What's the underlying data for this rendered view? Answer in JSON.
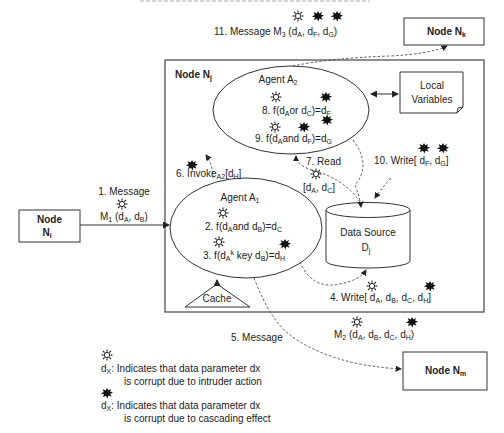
{
  "diagram": {
    "nodes": {
      "ni": {
        "line1": "Node",
        "line2": "N",
        "sub": "i"
      },
      "nj": {
        "label": "Node N",
        "sub": "j"
      },
      "nk": {
        "label": "Node N",
        "sub": "k"
      },
      "nm": {
        "label": "Node N",
        "sub": "m"
      }
    },
    "agent_a2": {
      "title": "Agent A",
      "title_sub": "2",
      "step8": {
        "pre": "8. f(d",
        "s1": "A",
        "mid": "or d",
        "s2": "C",
        "post": ")=d",
        "s3": "F"
      },
      "step9": {
        "pre": "9. f(d",
        "s1": "A",
        "mid": "and d",
        "s2": "F",
        "post": ")=d",
        "s3": "G"
      }
    },
    "agent_a1": {
      "title": "Agent A",
      "title_sub": "1",
      "step2": {
        "pre": "2. f(d",
        "s1": "A",
        "mid": "and d",
        "s2": "B",
        "post": ")=d",
        "s3": "C"
      },
      "step3": {
        "pre": "3. f(d",
        "s1": "A",
        "sup": "k",
        "mid": " key d",
        "s2": "B",
        "post": ")=d",
        "s3": "H"
      }
    },
    "local_variables": {
      "line1": "Local",
      "line2": "Variables"
    },
    "data_source": {
      "line1": "Data Source",
      "line2": "D",
      "sub": "j"
    },
    "cache": {
      "label": "Cache"
    },
    "edges": {
      "e1": {
        "line1": "1. Message",
        "m": "M",
        "msub": "1",
        "args": [
          " (d",
          "A",
          ", d",
          "B",
          ")"
        ]
      },
      "e4": {
        "pre": "4. Write[ d",
        "items": [
          "A",
          ", d",
          "B",
          ", d",
          "C",
          ", d",
          "H",
          "]"
        ]
      },
      "e5": {
        "label": "5. Message"
      },
      "e5m": {
        "m": "M",
        "msub": "2",
        "items": [
          " (d",
          "A",
          ", d",
          "B",
          ", d",
          "C",
          ", d",
          "H",
          ")"
        ]
      },
      "e6": {
        "pre": "6. Invoke",
        "sub": "A2",
        "post": "[d",
        "s2": "H",
        "end": "]"
      },
      "e7": {
        "label": "7. Read",
        "pre": "[d",
        "s1": "A",
        "mid": ", d",
        "s2": "C",
        "end": "]"
      },
      "e10": {
        "pre": "10. Write[ d",
        "s1": "F",
        "mid": ", d",
        "s2": "G",
        "end": "]"
      },
      "e11": {
        "pre": "11. Message M",
        "msub": "3",
        "a": " (d",
        "s1": "A",
        "b": ", d",
        "s2": "F",
        "c": ", d",
        "s3": "G",
        "end": ")"
      }
    },
    "legend": [
      {
        "icon": "intruder-icon",
        "var": "d",
        "sub": "X",
        "line1": ": Indicates that data parameter dx",
        "line2": "is corrupt due to intruder action"
      },
      {
        "icon": "cascade-icon",
        "var": "d",
        "sub": "X",
        "line1": ": Indicates that data parameter dx",
        "line2": "is corrupt due to cascading effect"
      }
    ]
  }
}
